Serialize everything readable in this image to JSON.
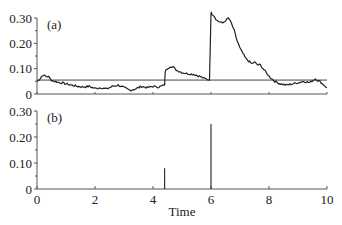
{
  "chart_data": [
    {
      "panel": "(a)",
      "type": "line",
      "title": "",
      "xlabel": "",
      "ylabel": "",
      "xlim": [
        0,
        10
      ],
      "ylim": [
        0,
        0.3
      ],
      "yticks": [
        "0",
        "0.10",
        "0.20",
        "0.30"
      ],
      "xticks_visible": false,
      "grid": false,
      "threshold": 0.055,
      "series": [
        {
          "name": "signal",
          "x": [
            0,
            0.1,
            0.2,
            0.3,
            0.4,
            0.5,
            0.6,
            0.8,
            1.0,
            1.2,
            1.4,
            1.6,
            1.8,
            2.0,
            2.2,
            2.4,
            2.6,
            2.8,
            3.0,
            3.2,
            3.4,
            3.6,
            3.8,
            4.0,
            4.2,
            4.4,
            4.42,
            4.5,
            4.6,
            4.7,
            4.8,
            5.0,
            5.2,
            5.4,
            5.6,
            5.8,
            5.95,
            6.0,
            6.02,
            6.1,
            6.2,
            6.3,
            6.4,
            6.5,
            6.6,
            6.7,
            6.8,
            6.9,
            7.0,
            7.1,
            7.2,
            7.3,
            7.4,
            7.5,
            7.6,
            7.7,
            7.8,
            7.9,
            8.0,
            8.2,
            8.4,
            8.6,
            8.8,
            9.0,
            9.2,
            9.4,
            9.6,
            9.8,
            10.0
          ],
          "y": [
            0.05,
            0.06,
            0.075,
            0.07,
            0.068,
            0.055,
            0.05,
            0.045,
            0.04,
            0.035,
            0.03,
            0.028,
            0.03,
            0.022,
            0.025,
            0.02,
            0.03,
            0.035,
            0.025,
            0.015,
            0.02,
            0.03,
            0.025,
            0.03,
            0.028,
            0.035,
            0.09,
            0.1,
            0.11,
            0.105,
            0.095,
            0.085,
            0.08,
            0.078,
            0.07,
            0.06,
            0.055,
            0.32,
            0.32,
            0.31,
            0.29,
            0.285,
            0.28,
            0.29,
            0.3,
            0.28,
            0.25,
            0.21,
            0.18,
            0.16,
            0.14,
            0.13,
            0.12,
            0.125,
            0.115,
            0.115,
            0.1,
            0.085,
            0.07,
            0.05,
            0.04,
            0.035,
            0.04,
            0.045,
            0.05,
            0.045,
            0.06,
            0.045,
            0.025
          ]
        }
      ]
    },
    {
      "panel": "(b)",
      "type": "bar",
      "title": "",
      "xlabel": "Time",
      "ylabel": "",
      "xlim": [
        0,
        10
      ],
      "ylim": [
        0,
        0.3
      ],
      "yticks": [
        "0",
        "0.10",
        "0.20",
        "0.30"
      ],
      "xticks": [
        "0",
        "2",
        "4",
        "6",
        "8",
        "10"
      ],
      "grid": false,
      "series": [
        {
          "name": "spikes",
          "x": [
            4.4,
            6.0
          ],
          "y": [
            0.08,
            0.25
          ]
        }
      ]
    }
  ],
  "labels": {
    "panel_a": "(a)",
    "panel_b": "(b)",
    "xlabel": "Time",
    "yticks": [
      "0",
      "0.10",
      "0.20",
      "0.30"
    ],
    "xticks": [
      "0",
      "2",
      "4",
      "6",
      "8",
      "10"
    ]
  }
}
